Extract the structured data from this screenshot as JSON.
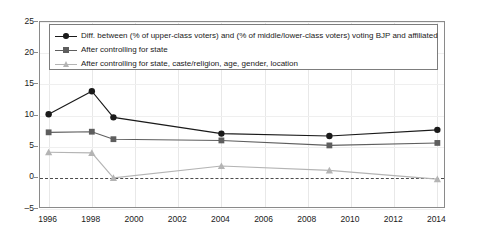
{
  "chart_data": {
    "type": "line",
    "title": "",
    "subtitle": "",
    "xlabel": "",
    "ylabel": "",
    "xlim": [
      1995.6,
      2014.4
    ],
    "ylim": [
      -5,
      25
    ],
    "grid": true,
    "legend_position": "top-left-inside",
    "zero_reference_line": 0,
    "x_ticks": [
      "1996",
      "1998",
      "2000",
      "2002",
      "2004",
      "2006",
      "2008",
      "2010",
      "2012",
      "2014"
    ],
    "x_tick_values": [
      1996,
      1998,
      2000,
      2002,
      2004,
      2006,
      2008,
      2010,
      2012,
      2014
    ],
    "y_ticks": [
      "25",
      "20",
      "15",
      "10",
      "5",
      "0",
      "-5"
    ],
    "y_tick_values": [
      25,
      20,
      15,
      10,
      5,
      0,
      -5
    ],
    "x": [
      1996,
      1998,
      1999,
      2004,
      2009,
      2014
    ],
    "series": [
      {
        "name": "Diff. between (% of upper-class voters) and (% of middle/lower-class voters) voting BJP and affiliated",
        "marker": "circle",
        "color": "#1a1a1a",
        "values": [
          10.2,
          13.9,
          9.7,
          7.1,
          6.7,
          7.7
        ]
      },
      {
        "name": "After controlling for state",
        "marker": "square",
        "color": "#5e5e5e",
        "values": [
          7.3,
          7.4,
          6.2,
          6.0,
          5.2,
          5.6
        ]
      },
      {
        "name": "After controlling for state, caste/religion, age, gender, location",
        "marker": "triangle",
        "color": "#b4b4b4",
        "values": [
          4.1,
          4.0,
          0.0,
          1.9,
          1.2,
          -0.2
        ]
      }
    ]
  },
  "legend": {
    "items": [
      {
        "label": "Diff. between (% of upper-class voters) and (% of middle/lower-class voters) voting BJP and affiliated",
        "marker": "circle",
        "color": "#1a1a1a"
      },
      {
        "label": "After controlling for state",
        "marker": "square",
        "color": "#5e5e5e"
      },
      {
        "label": "After controlling for state, caste/religion, age, gender, location",
        "marker": "triangle",
        "color": "#b4b4b4"
      }
    ]
  },
  "axes": {
    "y_labels": [
      "25",
      "20",
      "15",
      "10",
      "5",
      "0",
      "-5"
    ],
    "x_labels": [
      "1996",
      "1998",
      "2000",
      "2002",
      "2004",
      "2006",
      "2008",
      "2010",
      "2012",
      "2014"
    ]
  }
}
